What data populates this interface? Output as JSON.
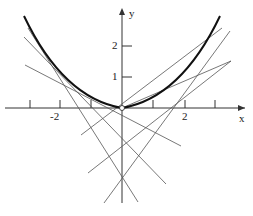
{
  "figure": {
    "curve": "y = cosh(x) - 1 (approx)",
    "axes": {
      "x_label": "x",
      "y_label": "y",
      "x_ticks": [
        "-2",
        "2"
      ],
      "y_ticks": [
        "1",
        "2"
      ]
    },
    "tangent_line_count": 8,
    "origin_marker": "open-circle"
  },
  "colors": {
    "curve": "#111111",
    "lines": "#555555",
    "axes": "#333333"
  }
}
